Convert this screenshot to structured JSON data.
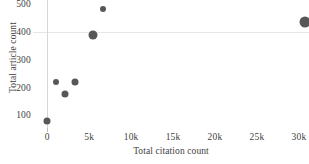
{
  "chart_data": {
    "type": "scatter",
    "title": "",
    "xlabel": "Total citation count",
    "ylabel": "Total article count",
    "xlim": [
      -1700,
      31200
    ],
    "ylim": [
      55,
      515
    ],
    "xticks": [
      0,
      5000,
      10000,
      15000,
      20000,
      25000,
      30000
    ],
    "xticklabels": [
      "0",
      "5k",
      "10k",
      "15k",
      "20k",
      "25k",
      "30k"
    ],
    "yticks": [
      100,
      200,
      300,
      400,
      500
    ],
    "yticklabels": [
      "100",
      "200",
      "300",
      "400",
      "500"
    ],
    "grid": "horizontal line at y=400 and vertical line at x=0 only",
    "legend": "none",
    "marker_color": "#575757",
    "gridline_color": "#e9e7e6",
    "points": [
      {
        "x": 0,
        "y": 80,
        "size": 7
      },
      {
        "x": 1100,
        "y": 219,
        "size": 6
      },
      {
        "x": 2100,
        "y": 178,
        "size": 7
      },
      {
        "x": 3250,
        "y": 219,
        "size": 7
      },
      {
        "x": 5400,
        "y": 390,
        "size": 9
      },
      {
        "x": 6600,
        "y": 484,
        "size": 6
      },
      {
        "x": 30700,
        "y": 437,
        "size": 11
      }
    ]
  }
}
